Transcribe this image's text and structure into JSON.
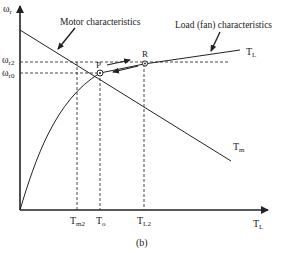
{
  "figure": {
    "caption": "(b)",
    "y_axis": {
      "label": "ω",
      "sub": "r"
    },
    "x_axis": {
      "label": "T",
      "sub": "L"
    },
    "y_ticks": [
      {
        "label": "ω",
        "sub": "r2"
      },
      {
        "label": "ω",
        "sub": "r0"
      }
    ],
    "x_ticks": [
      {
        "label": "T",
        "sub": "m2"
      },
      {
        "label": "T",
        "sub": "o"
      },
      {
        "label": "T",
        "sub": "L2"
      }
    ],
    "annotations": {
      "motor": "Motor characteristics",
      "load": "Load (fan) characteristics"
    },
    "curve_labels": {
      "load_end": {
        "label": "T",
        "sub": "L"
      },
      "motor_end": {
        "label": "T",
        "sub": "m"
      }
    },
    "points": {
      "p": "P",
      "r": "R"
    }
  }
}
